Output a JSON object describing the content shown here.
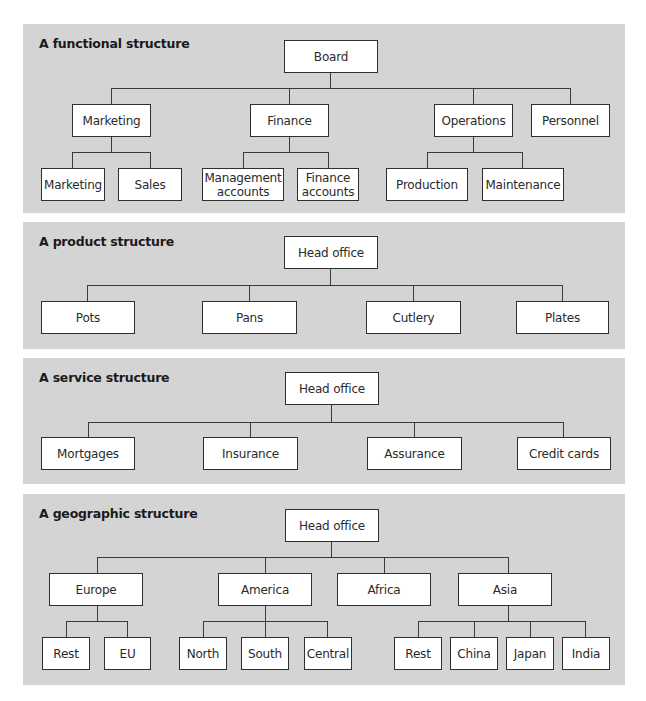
{
  "panels": [
    {
      "title": "A functional structure",
      "rect": [
        23,
        24,
        602,
        189
      ],
      "nodes": [
        {
          "id": "board",
          "label": "Board",
          "rect": [
            284,
            40,
            94,
            33
          ]
        },
        {
          "id": "marketing",
          "label": "Marketing",
          "rect": [
            72,
            104,
            79,
            33
          ]
        },
        {
          "id": "finance",
          "label": "Finance",
          "rect": [
            250,
            104,
            79,
            33
          ]
        },
        {
          "id": "operations",
          "label": "Operations",
          "rect": [
            434,
            104,
            79,
            33
          ]
        },
        {
          "id": "personnel",
          "label": "Personnel",
          "rect": [
            531,
            104,
            79,
            33
          ]
        },
        {
          "id": "marketing-sub",
          "label": "Marketing",
          "rect": [
            41,
            168,
            64,
            33
          ]
        },
        {
          "id": "sales",
          "label": "Sales",
          "rect": [
            118,
            168,
            64,
            33
          ]
        },
        {
          "id": "management-accounts",
          "label": "Management accounts",
          "rect": [
            202,
            168,
            82,
            33
          ]
        },
        {
          "id": "finance-accounts",
          "label": "Finance accounts",
          "rect": [
            297,
            168,
            62,
            33
          ]
        },
        {
          "id": "production",
          "label": "Production",
          "rect": [
            386,
            168,
            82,
            33
          ]
        },
        {
          "id": "maintenance",
          "label": "Maintenance",
          "rect": [
            482,
            168,
            82,
            33
          ]
        }
      ],
      "lines": [
        [
          330,
          73,
          1,
          15
        ],
        [
          111,
          88,
          460,
          1
        ],
        [
          111,
          88,
          1,
          16
        ],
        [
          289,
          88,
          1,
          16
        ],
        [
          473,
          88,
          1,
          16
        ],
        [
          570,
          88,
          1,
          16
        ],
        [
          111,
          137,
          1,
          15
        ],
        [
          72,
          152,
          79,
          1
        ],
        [
          72,
          152,
          1,
          16
        ],
        [
          150,
          152,
          1,
          16
        ],
        [
          289,
          137,
          1,
          15
        ],
        [
          243,
          152,
          86,
          1
        ],
        [
          243,
          152,
          1,
          16
        ],
        [
          328,
          152,
          1,
          16
        ],
        [
          473,
          137,
          1,
          15
        ],
        [
          427,
          152,
          96,
          1
        ],
        [
          427,
          152,
          1,
          16
        ],
        [
          522,
          152,
          1,
          16
        ]
      ]
    },
    {
      "title": "A product structure",
      "rect": [
        23,
        222,
        602,
        127
      ],
      "nodes": [
        {
          "id": "head-office",
          "label": "Head office",
          "rect": [
            284,
            236,
            94,
            33
          ]
        },
        {
          "id": "pots",
          "label": "Pots",
          "rect": [
            41,
            301,
            94,
            33
          ]
        },
        {
          "id": "pans",
          "label": "Pans",
          "rect": [
            202,
            301,
            95,
            33
          ]
        },
        {
          "id": "cutlery",
          "label": "Cutlery",
          "rect": [
            366,
            301,
            95,
            33
          ]
        },
        {
          "id": "plates",
          "label": "Plates",
          "rect": [
            516,
            301,
            93,
            33
          ]
        }
      ],
      "lines": [
        [
          330,
          269,
          1,
          16
        ],
        [
          87,
          285,
          476,
          1
        ],
        [
          87,
          285,
          1,
          16
        ],
        [
          249,
          285,
          1,
          16
        ],
        [
          413,
          285,
          1,
          16
        ],
        [
          562,
          285,
          1,
          16
        ]
      ]
    },
    {
      "title": "A service structure",
      "rect": [
        23,
        358,
        602,
        126
      ],
      "nodes": [
        {
          "id": "head-office",
          "label": "Head office",
          "rect": [
            285,
            372,
            94,
            33
          ]
        },
        {
          "id": "mortgages",
          "label": "Mortgages",
          "rect": [
            41,
            437,
            94,
            33
          ]
        },
        {
          "id": "insurance",
          "label": "Insurance",
          "rect": [
            203,
            437,
            95,
            33
          ]
        },
        {
          "id": "assurance",
          "label": "Assurance",
          "rect": [
            367,
            437,
            95,
            33
          ]
        },
        {
          "id": "credit-cards",
          "label": "Credit cards",
          "rect": [
            517,
            437,
            94,
            33
          ]
        }
      ],
      "lines": [
        [
          331,
          405,
          1,
          17
        ],
        [
          88,
          422,
          476,
          1
        ],
        [
          88,
          422,
          1,
          15
        ],
        [
          250,
          422,
          1,
          15
        ],
        [
          414,
          422,
          1,
          15
        ],
        [
          563,
          422,
          1,
          15
        ]
      ]
    },
    {
      "title": "A geographic structure",
      "rect": [
        23,
        494,
        602,
        191
      ],
      "nodes": [
        {
          "id": "head-office",
          "label": "Head office",
          "rect": [
            285,
            509,
            94,
            33
          ]
        },
        {
          "id": "europe",
          "label": "Europe",
          "rect": [
            49,
            573,
            94,
            33
          ]
        },
        {
          "id": "america",
          "label": "America",
          "rect": [
            218,
            573,
            94,
            33
          ]
        },
        {
          "id": "africa",
          "label": "Africa",
          "rect": [
            337,
            573,
            94,
            33
          ]
        },
        {
          "id": "asia",
          "label": "Asia",
          "rect": [
            458,
            573,
            94,
            33
          ]
        },
        {
          "id": "europe-rest",
          "label": "Rest",
          "rect": [
            42,
            637,
            48,
            33
          ]
        },
        {
          "id": "eu",
          "label": "EU",
          "rect": [
            104,
            637,
            47,
            33
          ]
        },
        {
          "id": "north",
          "label": "North",
          "rect": [
            179,
            637,
            48,
            33
          ]
        },
        {
          "id": "south",
          "label": "South",
          "rect": [
            241,
            637,
            48,
            33
          ]
        },
        {
          "id": "central",
          "label": "Central",
          "rect": [
            304,
            637,
            48,
            33
          ]
        },
        {
          "id": "asia-rest",
          "label": "Rest",
          "rect": [
            394,
            637,
            48,
            33
          ]
        },
        {
          "id": "china",
          "label": "China",
          "rect": [
            450,
            637,
            48,
            33
          ]
        },
        {
          "id": "japan",
          "label": "Japan",
          "rect": [
            506,
            637,
            48,
            33
          ]
        },
        {
          "id": "india",
          "label": "India",
          "rect": [
            562,
            637,
            48,
            33
          ]
        }
      ],
      "lines": [
        [
          331,
          542,
          1,
          15
        ],
        [
          97,
          557,
          412,
          1
        ],
        [
          97,
          557,
          1,
          16
        ],
        [
          265,
          557,
          1,
          16
        ],
        [
          384,
          557,
          1,
          16
        ],
        [
          508,
          557,
          1,
          16
        ],
        [
          97,
          606,
          1,
          15
        ],
        [
          66,
          621,
          62,
          1
        ],
        [
          66,
          621,
          1,
          16
        ],
        [
          127,
          621,
          1,
          16
        ],
        [
          265,
          606,
          1,
          15
        ],
        [
          203,
          621,
          125,
          1
        ],
        [
          203,
          621,
          1,
          16
        ],
        [
          265,
          621,
          1,
          16
        ],
        [
          327,
          621,
          1,
          16
        ],
        [
          508,
          606,
          1,
          15
        ],
        [
          418,
          621,
          168,
          1
        ],
        [
          418,
          621,
          1,
          16
        ],
        [
          474,
          621,
          1,
          16
        ],
        [
          530,
          621,
          1,
          16
        ],
        [
          585,
          621,
          1,
          16
        ]
      ]
    }
  ]
}
